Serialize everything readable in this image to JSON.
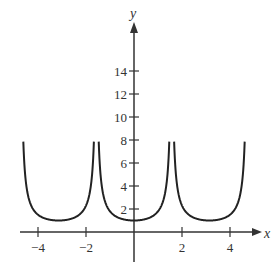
{
  "chart_data": {
    "type": "line",
    "title": "",
    "xlabel": "x",
    "ylabel": "y",
    "xlim": [
      -4.5,
      5
    ],
    "ylim": [
      0,
      16
    ],
    "x_ticks": [
      -4,
      -2,
      2,
      4
    ],
    "x_tick_labels": [
      "−4",
      "−2",
      "2",
      "4"
    ],
    "y_ticks": [
      2,
      4,
      6,
      8,
      10,
      12,
      14
    ],
    "y_tick_labels": [
      "2",
      "4",
      "6",
      "8",
      "10",
      "12",
      "14"
    ],
    "grid": false,
    "branches": [
      {
        "x_range": [
          -4.3,
          -1.8
        ],
        "minimum": {
          "x": -3.14,
          "y": 1
        }
      },
      {
        "x_range": [
          -1.3,
          1.3
        ],
        "minimum": {
          "x": 0,
          "y": 1
        }
      },
      {
        "x_range": [
          1.8,
          4.3
        ],
        "minimum": {
          "x": 3.14,
          "y": 1
        }
      }
    ],
    "color": "#222222"
  }
}
